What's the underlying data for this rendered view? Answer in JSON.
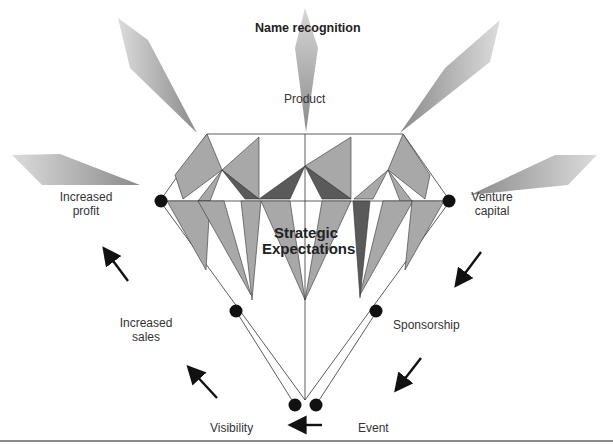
{
  "diagram": {
    "title": "Name recognition",
    "center_label_line1": "Strategic",
    "center_label_line2": "Expectations",
    "nodes": {
      "product": "Product",
      "increased_profit_1": "Increased",
      "increased_profit_2": "profit",
      "venture_capital_1": "Venture",
      "venture_capital_2": "capital",
      "increased_sales_1": "Increased",
      "increased_sales_2": "sales",
      "sponsorship": "Sponsorship",
      "visibility": "Visibility",
      "event": "Event"
    },
    "colors": {
      "facet_light": "#a8a8a8",
      "facet_dark": "#5a5a5a",
      "dot": "#111111",
      "line": "#333333",
      "ray": "#b0b0b0"
    }
  }
}
